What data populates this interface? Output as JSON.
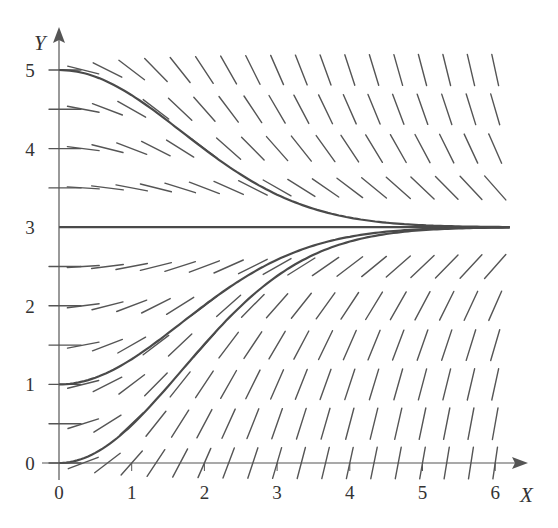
{
  "chart_data": {
    "type": "line",
    "subtype": "slope-field",
    "title": "",
    "xlabel": "X",
    "ylabel": "Y",
    "xlim": [
      0,
      6.2
    ],
    "ylim": [
      0,
      5.2
    ],
    "x_ticks": [
      "0",
      "1",
      "2",
      "3",
      "4",
      "5",
      "6"
    ],
    "y_ticks": [
      "0",
      "1",
      "2",
      "3",
      "4",
      "5"
    ],
    "grid": false,
    "legend": null,
    "slope_field": {
      "equation": "dy/dx = 0.35 * x * (3 - y)",
      "x_step": 0.333,
      "y_step": 0.5,
      "x_range": [
        0,
        6.0
      ],
      "y_range": [
        0,
        5.0
      ]
    },
    "series": [
      {
        "name": "solution y(0)=5",
        "y0": 5,
        "points": [
          [
            0,
            5
          ],
          [
            1,
            4.68
          ],
          [
            2,
            4.0
          ],
          [
            3,
            3.42
          ],
          [
            4,
            3.13
          ],
          [
            5,
            3.03
          ],
          [
            6.2,
            3.0
          ]
        ]
      },
      {
        "name": "equilibrium y=3",
        "y0": 3,
        "points": [
          [
            0,
            3
          ],
          [
            6.2,
            3
          ]
        ]
      },
      {
        "name": "solution y(0)=1",
        "y0": 1,
        "points": [
          [
            0,
            1
          ],
          [
            1,
            1.32
          ],
          [
            2,
            2.0
          ],
          [
            3,
            2.58
          ],
          [
            4,
            2.87
          ],
          [
            5,
            2.97
          ],
          [
            6.2,
            3.0
          ]
        ]
      },
      {
        "name": "solution y(0)=0",
        "y0": 0,
        "points": [
          [
            0,
            0
          ],
          [
            1,
            0.48
          ],
          [
            2,
            1.5
          ],
          [
            3,
            2.37
          ],
          [
            4,
            2.81
          ],
          [
            5,
            2.96
          ],
          [
            6.2,
            3.0
          ]
        ]
      }
    ]
  },
  "colors": {
    "axis": "#555555",
    "curve": "#4a4a4a",
    "segment": "#555555",
    "text": "#333333"
  }
}
